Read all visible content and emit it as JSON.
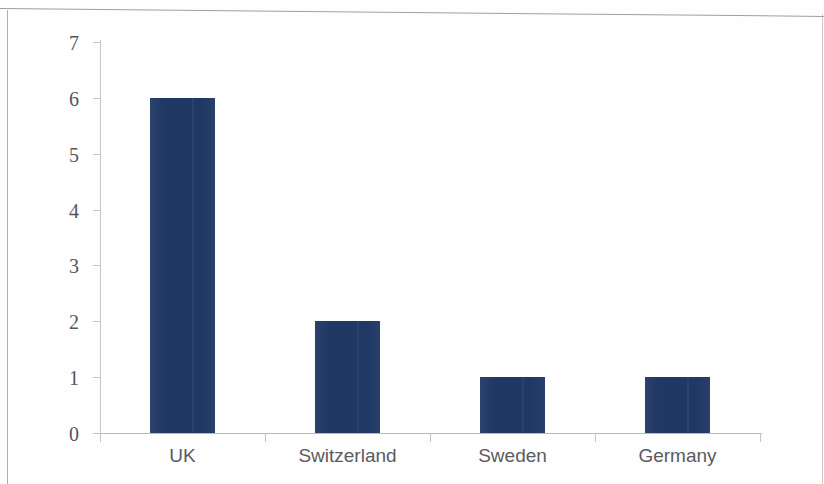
{
  "chart_data": {
    "type": "bar",
    "title": "",
    "subtitle": "",
    "xlabel": "",
    "ylabel": "",
    "categories": [
      "UK",
      "Switzerland",
      "Sweden",
      "Germany"
    ],
    "values": [
      6,
      2,
      1,
      1
    ],
    "series": [
      {
        "name": "",
        "values": [
          6,
          2,
          1,
          1
        ]
      }
    ],
    "ylim": [
      0,
      7
    ],
    "ytick_labels": [
      "0",
      "1",
      "2",
      "3",
      "4",
      "5",
      "6",
      "7"
    ],
    "ytick_values": [
      0,
      1,
      2,
      3,
      4,
      5,
      6,
      7
    ],
    "grid": false,
    "legend": false,
    "legend_position": "none",
    "annotations": [],
    "bar_color": "#1F3864",
    "axis_color": "#C4C4C4",
    "tick_label_color": "#55565A"
  }
}
